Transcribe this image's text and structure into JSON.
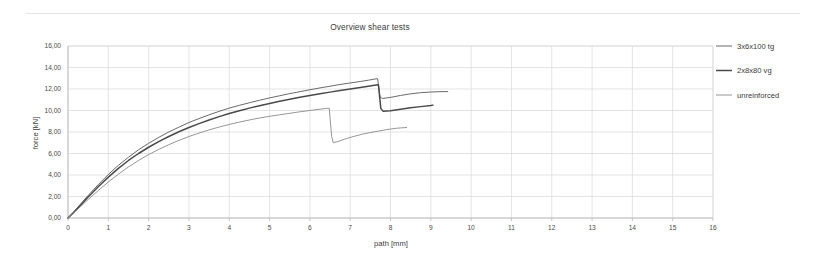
{
  "chart_data": {
    "type": "line",
    "title": "Overview shear tests",
    "xlabel": "path  [mm]",
    "ylabel": "force [kN]",
    "xlim": [
      0,
      16
    ],
    "ylim": [
      0,
      16
    ],
    "grid": true,
    "legend_position": "right",
    "xticks": [
      "0",
      "1",
      "2",
      "3",
      "4",
      "5",
      "6",
      "7",
      "8",
      "9",
      "10",
      "11",
      "12",
      "13",
      "14",
      "15",
      "16"
    ],
    "yticks": [
      "0,00",
      "2,00",
      "4,00",
      "6,00",
      "8,00",
      "10,00",
      "12,00",
      "14,00",
      "16,00"
    ],
    "xtick_values": [
      0,
      1,
      2,
      3,
      4,
      5,
      6,
      7,
      8,
      9,
      10,
      11,
      12,
      13,
      14,
      15,
      16
    ],
    "ytick_values": [
      0,
      2,
      4,
      6,
      8,
      10,
      12,
      14,
      16
    ],
    "series": [
      {
        "name": "3x6x100 tg",
        "color": "#595959",
        "width": 0.9,
        "points": [
          [
            0.0,
            0.0
          ],
          [
            0.15,
            0.6
          ],
          [
            0.3,
            1.25
          ],
          [
            0.5,
            2.1
          ],
          [
            0.75,
            3.1
          ],
          [
            1.0,
            4.05
          ],
          [
            1.25,
            4.9
          ],
          [
            1.5,
            5.65
          ],
          [
            1.75,
            6.35
          ],
          [
            2.0,
            6.95
          ],
          [
            2.25,
            7.5
          ],
          [
            2.5,
            8.0
          ],
          [
            2.75,
            8.45
          ],
          [
            3.0,
            8.88
          ],
          [
            3.25,
            9.25
          ],
          [
            3.5,
            9.6
          ],
          [
            3.75,
            9.92
          ],
          [
            4.0,
            10.22
          ],
          [
            4.25,
            10.48
          ],
          [
            4.5,
            10.72
          ],
          [
            4.75,
            10.95
          ],
          [
            5.0,
            11.17
          ],
          [
            5.25,
            11.37
          ],
          [
            5.5,
            11.57
          ],
          [
            5.75,
            11.75
          ],
          [
            6.0,
            11.93
          ],
          [
            6.25,
            12.1
          ],
          [
            6.5,
            12.26
          ],
          [
            6.75,
            12.42
          ],
          [
            7.0,
            12.56
          ],
          [
            7.25,
            12.7
          ],
          [
            7.45,
            12.82
          ],
          [
            7.6,
            12.92
          ],
          [
            7.68,
            12.96
          ],
          [
            7.74,
            11.25
          ],
          [
            7.8,
            11.12
          ],
          [
            8.0,
            11.22
          ],
          [
            8.25,
            11.4
          ],
          [
            8.5,
            11.55
          ],
          [
            8.75,
            11.66
          ],
          [
            9.0,
            11.72
          ],
          [
            9.2,
            11.75
          ],
          [
            9.42,
            11.76
          ]
        ]
      },
      {
        "name": "2x8x80 vg",
        "color": "#4a4a4a",
        "width": 1.5,
        "points": [
          [
            0.0,
            0.0
          ],
          [
            0.15,
            0.55
          ],
          [
            0.3,
            1.15
          ],
          [
            0.5,
            1.95
          ],
          [
            0.75,
            2.9
          ],
          [
            1.0,
            3.8
          ],
          [
            1.25,
            4.62
          ],
          [
            1.5,
            5.35
          ],
          [
            1.75,
            6.0
          ],
          [
            2.0,
            6.58
          ],
          [
            2.25,
            7.1
          ],
          [
            2.5,
            7.58
          ],
          [
            2.75,
            8.02
          ],
          [
            3.0,
            8.42
          ],
          [
            3.25,
            8.78
          ],
          [
            3.5,
            9.12
          ],
          [
            3.75,
            9.43
          ],
          [
            4.0,
            9.72
          ],
          [
            4.25,
            9.98
          ],
          [
            4.5,
            10.22
          ],
          [
            4.75,
            10.45
          ],
          [
            5.0,
            10.66
          ],
          [
            5.25,
            10.86
          ],
          [
            5.5,
            11.05
          ],
          [
            5.75,
            11.23
          ],
          [
            6.0,
            11.4
          ],
          [
            6.25,
            11.56
          ],
          [
            6.5,
            11.71
          ],
          [
            6.75,
            11.86
          ],
          [
            7.0,
            12.0
          ],
          [
            7.25,
            12.14
          ],
          [
            7.45,
            12.26
          ],
          [
            7.6,
            12.35
          ],
          [
            7.7,
            12.4
          ],
          [
            7.76,
            10.2
          ],
          [
            7.82,
            9.92
          ],
          [
            8.0,
            9.98
          ],
          [
            8.25,
            10.12
          ],
          [
            8.5,
            10.25
          ],
          [
            8.75,
            10.36
          ],
          [
            9.0,
            10.46
          ],
          [
            9.05,
            10.5
          ]
        ]
      },
      {
        "name": "unreinforced",
        "color": "#8a8a8a",
        "width": 0.9,
        "points": [
          [
            0.0,
            0.0
          ],
          [
            0.15,
            0.5
          ],
          [
            0.3,
            1.02
          ],
          [
            0.5,
            1.72
          ],
          [
            0.75,
            2.55
          ],
          [
            1.0,
            3.35
          ],
          [
            1.25,
            4.08
          ],
          [
            1.5,
            4.75
          ],
          [
            1.75,
            5.35
          ],
          [
            2.0,
            5.9
          ],
          [
            2.25,
            6.38
          ],
          [
            2.5,
            6.82
          ],
          [
            2.75,
            7.22
          ],
          [
            3.0,
            7.58
          ],
          [
            3.25,
            7.9
          ],
          [
            3.5,
            8.2
          ],
          [
            3.75,
            8.46
          ],
          [
            4.0,
            8.7
          ],
          [
            4.25,
            8.92
          ],
          [
            4.5,
            9.12
          ],
          [
            4.75,
            9.3
          ],
          [
            5.0,
            9.46
          ],
          [
            5.25,
            9.6
          ],
          [
            5.5,
            9.74
          ],
          [
            5.75,
            9.88
          ],
          [
            6.0,
            10.0
          ],
          [
            6.2,
            10.1
          ],
          [
            6.38,
            10.18
          ],
          [
            6.48,
            10.22
          ],
          [
            6.54,
            7.6
          ],
          [
            6.58,
            7.0
          ],
          [
            6.7,
            7.12
          ],
          [
            6.9,
            7.38
          ],
          [
            7.1,
            7.6
          ],
          [
            7.3,
            7.8
          ],
          [
            7.6,
            8.02
          ],
          [
            7.9,
            8.22
          ],
          [
            8.15,
            8.35
          ],
          [
            8.4,
            8.42
          ]
        ]
      }
    ]
  },
  "axes": {
    "x_title": "path  [mm]",
    "y_title": "force [kN]"
  },
  "legend": {
    "items": [
      {
        "label": "3x6x100 tg"
      },
      {
        "label": "2x8x80 vg"
      },
      {
        "label": "unreinforced"
      }
    ]
  }
}
